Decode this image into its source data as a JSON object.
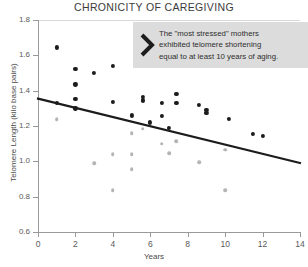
{
  "chart_data": {
    "type": "scatter",
    "title": "CHRONICITY OF CAREGIVING",
    "xlabel": "Years",
    "ylabel": "Telomere Length (kilo base pairs)",
    "xlim": [
      0,
      14
    ],
    "ylim": [
      0.6,
      1.8
    ],
    "xticks": [
      "0",
      "2",
      "4",
      "6",
      "8",
      "10",
      "12",
      "14"
    ],
    "yticks": [
      "1.8",
      "1.6",
      "1.4",
      "1.2",
      "1.0",
      "0.8",
      "0.6"
    ],
    "grid": false,
    "legend": "none",
    "series": [
      {
        "name": "primary-points",
        "color": "#1c1c1c",
        "points": [
          [
            1.0,
            1.645
          ],
          [
            2.0,
            1.525
          ],
          [
            2.0,
            1.435
          ],
          [
            2.0,
            1.355
          ],
          [
            2.0,
            1.3
          ],
          [
            1.0,
            1.33
          ],
          [
            3.0,
            1.5
          ],
          [
            4.0,
            1.54
          ],
          [
            4.0,
            1.335
          ],
          [
            5.6,
            1.365
          ],
          [
            5.6,
            1.35
          ],
          [
            5.6,
            1.34
          ],
          [
            5.0,
            1.26
          ],
          [
            6.0,
            1.22
          ],
          [
            6.6,
            1.33
          ],
          [
            6.6,
            1.255
          ],
          [
            7.0,
            1.19
          ],
          [
            7.4,
            1.38
          ],
          [
            7.4,
            1.33
          ],
          [
            8.6,
            1.32
          ],
          [
            9.0,
            1.29
          ],
          [
            9.0,
            1.275
          ],
          [
            10.2,
            1.24
          ],
          [
            11.5,
            1.155
          ],
          [
            12.0,
            1.145
          ]
        ]
      },
      {
        "name": "secondary-points",
        "color": "#b4b4b4",
        "points": [
          [
            1.0,
            1.24
          ],
          [
            3.0,
            0.99
          ],
          [
            4.0,
            1.04
          ],
          [
            4.0,
            0.835
          ],
          [
            5.0,
            1.16
          ],
          [
            5.0,
            1.04
          ],
          [
            5.0,
            0.955
          ],
          [
            5.6,
            1.185
          ],
          [
            6.6,
            1.1
          ],
          [
            7.0,
            1.045
          ],
          [
            7.4,
            1.115
          ],
          [
            8.6,
            0.995
          ],
          [
            10.0,
            1.065
          ],
          [
            10.0,
            0.835
          ]
        ]
      }
    ],
    "trendline": {
      "name": "regression-line",
      "color": "#1c1c1c",
      "x_start": 0,
      "y_start": 1.355,
      "x_end": 14,
      "y_end": 0.99
    }
  },
  "callout": {
    "icon": "chevron-right-icon",
    "text": "The \"most stressed\" mothers\nexhibited telomere shortening\nequal to at least 10 years of aging."
  }
}
